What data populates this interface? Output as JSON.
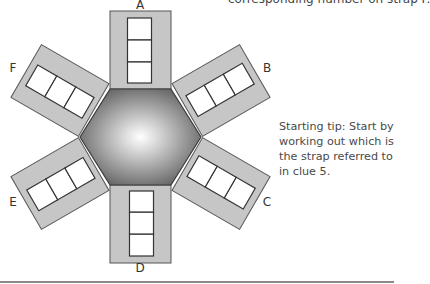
{
  "top_text": "corresponding number on strap F.",
  "starting_tip": "Starting tip: Start by working out which is the strap referred to in clue 5.",
  "straps": [
    {
      "label": "A",
      "angle": 0,
      "cells": 3
    },
    {
      "label": "B",
      "angle": 60,
      "cells": 3
    },
    {
      "label": "C",
      "angle": 120,
      "cells": 3
    },
    {
      "label": "D",
      "angle": 180,
      "cells": 3
    },
    {
      "label": "E",
      "angle": 240,
      "cells": 3
    },
    {
      "label": "F",
      "angle": 300,
      "cells": 3
    }
  ],
  "colors": {
    "strap_fill": "#c6c6c6",
    "strap_stroke": "#555555",
    "cell_fill": "#ffffff",
    "hex_center": "#ffffff",
    "hex_edge": "#5e5e5e"
  }
}
